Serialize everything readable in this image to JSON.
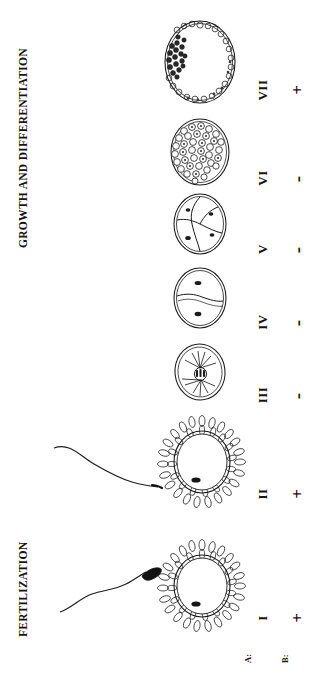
{
  "figure": {
    "orientation": "rotated-90",
    "background_color": "#ffffff",
    "ink_color": "#141414"
  },
  "sections": [
    {
      "id": "growth",
      "label": "GROWTH AND DIFFERENTIATION"
    },
    {
      "id": "fertilization",
      "label": "FERTILIZATION"
    }
  ],
  "row_labels": {
    "a": "A:",
    "b": "B:"
  },
  "stages": [
    {
      "numeral": "VII",
      "mark": "+",
      "mark_kind": "plus",
      "illustration": "blastocyst",
      "description": "Blastocyst with inner cell mass and blastocoel cavity",
      "has_sperm": false
    },
    {
      "numeral": "VI",
      "mark": "-",
      "mark_kind": "minus",
      "illustration": "morula",
      "description": "Morula, many-celled solid ball",
      "has_sperm": false
    },
    {
      "numeral": "V",
      "mark": "-",
      "mark_kind": "minus",
      "illustration": "four-cell",
      "description": "Four-cell stage embryo",
      "has_sperm": false
    },
    {
      "numeral": "IV",
      "mark": "-",
      "mark_kind": "minus",
      "illustration": "two-cell",
      "description": "Two-cell stage embryo",
      "has_sperm": false
    },
    {
      "numeral": "III",
      "mark": "-",
      "mark_kind": "minus",
      "illustration": "zygote-spindle",
      "description": "Zygote with mitotic spindle and astral rays",
      "has_sperm": false
    },
    {
      "numeral": "II",
      "mark": "+",
      "mark_kind": "plus",
      "illustration": "oocyte-corona-penetrated",
      "description": "Oocyte surrounded by corona radiata, sperm penetrating",
      "has_sperm": true
    },
    {
      "numeral": "I",
      "mark": "+",
      "mark_kind": "plus",
      "illustration": "oocyte-corona",
      "description": "Oocyte surrounded by corona radiata, sperm approaching",
      "has_sperm": true
    }
  ]
}
